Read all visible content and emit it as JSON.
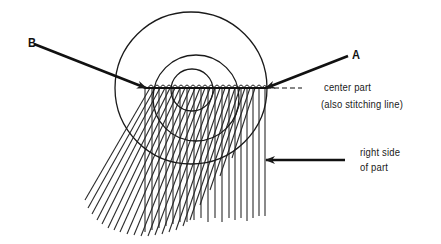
{
  "diagram": {
    "colors": {
      "ink": "#1a1a1a",
      "background": "#ffffff"
    },
    "labels": {
      "point_a": "A",
      "point_b": "B",
      "center_part_line1": "center part",
      "center_part_line2": "(also stitching line)",
      "right_side_line1": "right side",
      "right_side_line2": "of part"
    },
    "geometry": {
      "stitch_line": {
        "y": 88,
        "x_start": 145,
        "x_end": 265,
        "dashed_end": 300
      },
      "circles": [
        {
          "name": "outer",
          "cx": 195,
          "cy": 88,
          "r": 75
        },
        {
          "name": "middle",
          "cx": 196,
          "cy": 100,
          "r": 43
        },
        {
          "name": "inner",
          "cx": 190,
          "cy": 90,
          "r": 21
        }
      ],
      "arrows": [
        {
          "name": "arrow-b",
          "from": [
            28,
            42
          ],
          "to": [
            146,
            88
          ]
        },
        {
          "name": "arrow-a",
          "from": [
            352,
            55
          ],
          "to": [
            266,
            88
          ]
        },
        {
          "name": "arrow-right-side",
          "from": [
            345,
            160
          ],
          "to": [
            266,
            160
          ]
        }
      ]
    }
  }
}
